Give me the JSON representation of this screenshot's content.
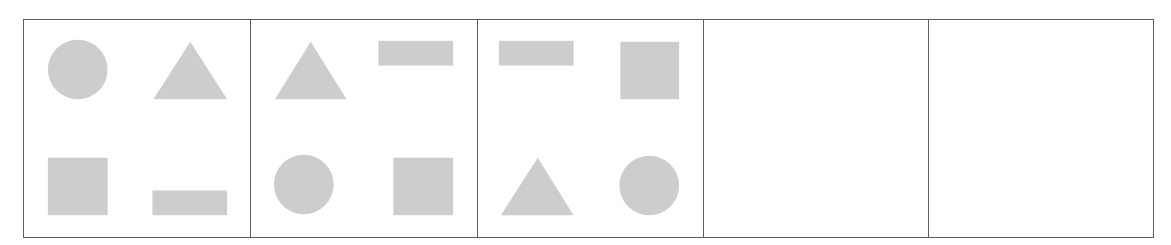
{
  "diagram": {
    "type": "shape-sequence-puzzle",
    "colors": {
      "border": "#5e5e5e",
      "shape_fill": "#cdcdcd",
      "background": "#ffffff"
    },
    "panels": [
      {
        "index": 1,
        "filled": true,
        "shapes": {
          "top_left": "circle",
          "top_right": "triangle",
          "bottom_left": "square",
          "bottom_right": "rectangle"
        }
      },
      {
        "index": 2,
        "filled": true,
        "shapes": {
          "top_left": "triangle",
          "top_right": "rectangle",
          "bottom_left": "circle",
          "bottom_right": "square"
        }
      },
      {
        "index": 3,
        "filled": true,
        "shapes": {
          "top_left": "rectangle",
          "top_right": "square",
          "bottom_left": "triangle",
          "bottom_right": "circle"
        }
      },
      {
        "index": 4,
        "filled": false,
        "shapes": {}
      },
      {
        "index": 5,
        "filled": false,
        "shapes": {}
      }
    ]
  }
}
